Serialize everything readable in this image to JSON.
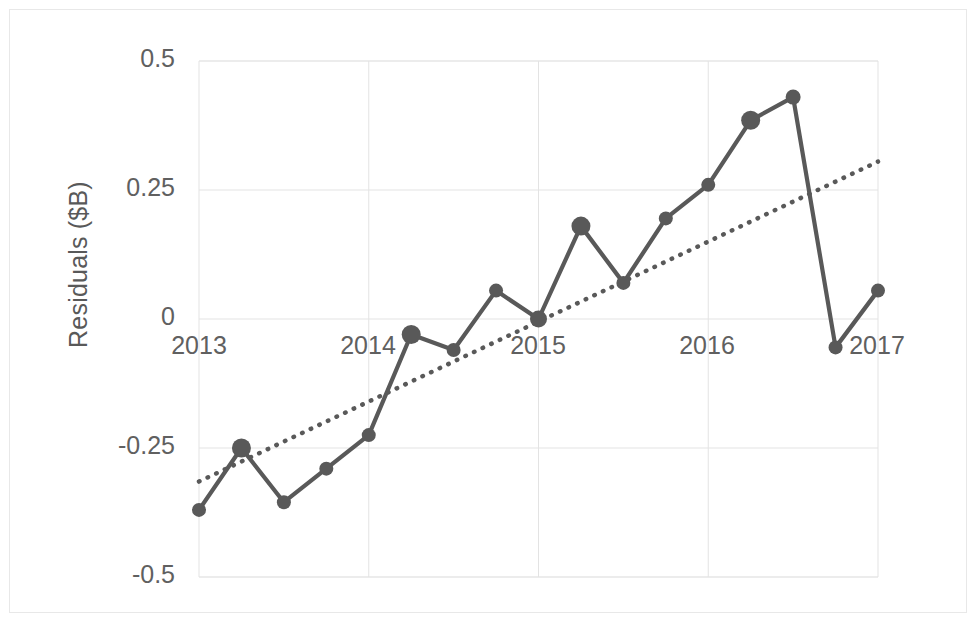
{
  "chart_data": {
    "type": "line",
    "title": "",
    "subtitle": "",
    "xlabel": "",
    "ylabel": "Residuals ($B)",
    "ylim": [
      -0.5,
      0.5
    ],
    "xlim": [
      2013.0,
      2017.0
    ],
    "grid": true,
    "legend": "none",
    "y_ticks": [
      "0.5",
      "0.25",
      "0",
      "-0.25",
      "-0.5"
    ],
    "y_tick_values": [
      0.5,
      0.25,
      0,
      -0.25,
      -0.5
    ],
    "x_ticks": [
      "2013",
      "2014",
      "2015",
      "2016",
      "2017"
    ],
    "x_tick_values": [
      2013,
      2014,
      2015,
      2016,
      2017
    ],
    "series": [
      {
        "name": "Residuals",
        "style": "solid-line-with-markers",
        "color": "#595959",
        "x": [
          2013.0,
          2013.25,
          2013.5,
          2013.75,
          2014.0,
          2014.25,
          2014.5,
          2014.75,
          2015.0,
          2015.25,
          2015.5,
          2015.75,
          2016.0,
          2016.25,
          2016.5,
          2016.75,
          2017.0
        ],
        "values": [
          -0.37,
          -0.25,
          -0.355,
          -0.29,
          -0.225,
          -0.03,
          -0.06,
          0.055,
          0.0,
          0.18,
          0.07,
          0.195,
          0.26,
          0.385,
          0.43,
          -0.055,
          0.055
        ],
        "marker_sizes": [
          9,
          14,
          9,
          9,
          9,
          14,
          9,
          9,
          12,
          14,
          9,
          9,
          9,
          14,
          10,
          9,
          9
        ]
      },
      {
        "name": "Trendline",
        "style": "dotted-line",
        "color": "#595959",
        "x": [
          2013.0,
          2017.0
        ],
        "values": [
          -0.315,
          0.305
        ]
      }
    ]
  },
  "axis": {
    "y_title": "Residuals ($B)"
  }
}
